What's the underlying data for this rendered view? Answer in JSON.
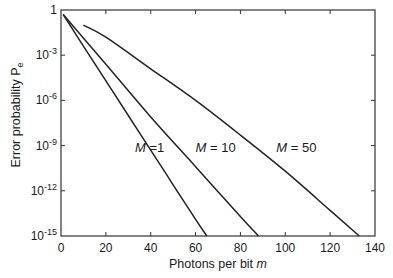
{
  "chart_data": {
    "type": "line",
    "title": "",
    "xlabel": "Photons per bit m",
    "xlabel_parts": {
      "text": "Photons per bit ",
      "var": "m"
    },
    "ylabel": "Error probability Pe",
    "ylabel_parts": {
      "text": "Error probability ",
      "var": "P",
      "sub": "e"
    },
    "xlim": [
      0,
      140
    ],
    "ylim_log10": [
      -15,
      0
    ],
    "yscale": "log",
    "grid": false,
    "legend": "inline labels",
    "x_ticks": [
      0,
      20,
      40,
      60,
      80,
      100,
      120,
      140
    ],
    "y_ticks": [
      {
        "exp": 0,
        "label": "1"
      },
      {
        "exp": -3,
        "label": "10",
        "sup": "-3"
      },
      {
        "exp": -6,
        "label": "10",
        "sup": "-6"
      },
      {
        "exp": -9,
        "label": "10",
        "sup": "-9"
      },
      {
        "exp": -12,
        "label": "10",
        "sup": "-12"
      },
      {
        "exp": -15,
        "label": "10",
        "sup": "-15"
      }
    ],
    "series": [
      {
        "name": "M = 1",
        "label_var": "M",
        "label_val": "=1",
        "label_pos": {
          "m": 33,
          "log10": -9.4
        },
        "points": [
          [
            1,
            -0.3
          ],
          [
            10,
            -2.4
          ],
          [
            20,
            -4.7
          ],
          [
            30,
            -7.0
          ],
          [
            40,
            -9.3
          ],
          [
            50,
            -11.6
          ],
          [
            60,
            -13.9
          ],
          [
            65,
            -15.0
          ]
        ]
      },
      {
        "name": "M = 10",
        "label_var": "M",
        "label_val": "= 10",
        "label_pos": {
          "m": 60,
          "log10": -9.4
        },
        "points": [
          [
            1,
            -0.3
          ],
          [
            20,
            -3.6
          ],
          [
            40,
            -7.1
          ],
          [
            60,
            -10.4
          ],
          [
            80,
            -13.7
          ],
          [
            88,
            -15.0
          ]
        ]
      },
      {
        "name": "M = 50",
        "label_var": "M",
        "label_val": "= 50",
        "label_pos": {
          "m": 96,
          "log10": -9.4
        },
        "points": [
          [
            10,
            -1.0
          ],
          [
            20,
            -1.8
          ],
          [
            40,
            -3.9
          ],
          [
            60,
            -6.0
          ],
          [
            80,
            -8.3
          ],
          [
            100,
            -10.7
          ],
          [
            120,
            -13.3
          ],
          [
            133,
            -15.0
          ]
        ]
      }
    ]
  },
  "colors": {
    "line": "#222222",
    "axis": "#333333",
    "background": "#ffffff"
  }
}
